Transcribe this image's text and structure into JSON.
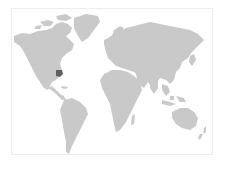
{
  "map": {
    "type": "world-map",
    "projection": "equirectangular-like",
    "colors": {
      "land": "#c9c9c9",
      "highlight": "#5f5f5f",
      "background": "#ffffff",
      "frame": "#ececec"
    },
    "highlighted_regions": [
      {
        "name": "Southeastern United States",
        "label": "Highlighted region"
      }
    ]
  }
}
